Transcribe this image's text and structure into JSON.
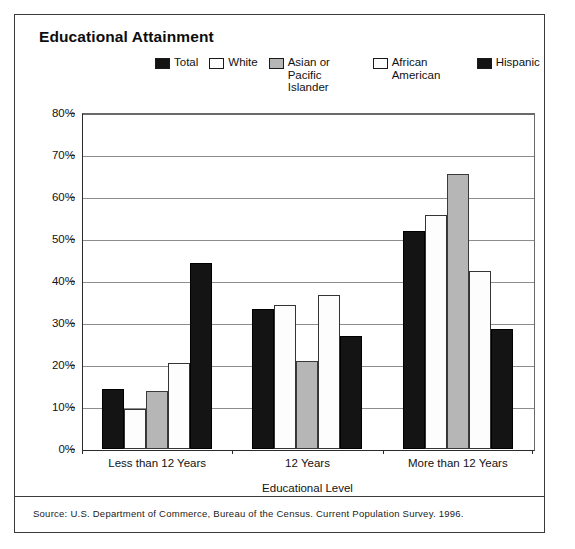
{
  "figure": {
    "title": "Educational Attainment",
    "source_note": "Source:  U.S. Department of Commerce, Bureau of the Census. Current Population Survey. 1996."
  },
  "legend": {
    "position": "top-center",
    "entries": [
      {
        "label": "Total",
        "swatch": "black-square-icon",
        "color": "#141414"
      },
      {
        "label": "White",
        "swatch": "white-square-icon",
        "color": "#fdfdfd"
      },
      {
        "label": "Asian or Pacific Islander",
        "swatch": "gray-square-icon",
        "color": "#b6b6b6"
      },
      {
        "label": "African American",
        "swatch": "white-square-icon",
        "color": "#fdfdfd"
      },
      {
        "label": "Hispanic",
        "swatch": "black-square-icon",
        "color": "#141414"
      }
    ]
  },
  "axes": {
    "y_ticks": [
      "0%",
      "10%",
      "20%",
      "30%",
      "40%",
      "50%",
      "60%",
      "70%",
      "80%"
    ],
    "x_title": "Educational Level"
  },
  "chart_data": {
    "type": "bar",
    "title": "Educational Attainment",
    "xlabel": "Educational Level",
    "ylabel": "",
    "ylim": [
      0,
      80
    ],
    "ytick_step": 10,
    "ytick_suffix": "%",
    "grid": true,
    "legend_position": "top-center",
    "categories": [
      "Less than 12 Years",
      "12 Years",
      "More than 12 Years"
    ],
    "series": [
      {
        "name": "Total",
        "fill": "black",
        "values": [
          14.3,
          33.3,
          52.0
        ]
      },
      {
        "name": "White",
        "fill": "white",
        "values": [
          9.5,
          34.2,
          55.7
        ]
      },
      {
        "name": "Asian or Pacific Islander",
        "fill": "gray",
        "values": [
          13.9,
          21.0,
          65.5
        ]
      },
      {
        "name": "African American",
        "fill": "white",
        "values": [
          20.5,
          36.7,
          42.3
        ]
      },
      {
        "name": "Hispanic",
        "fill": "black",
        "values": [
          44.2,
          27.0,
          28.5
        ]
      }
    ]
  }
}
